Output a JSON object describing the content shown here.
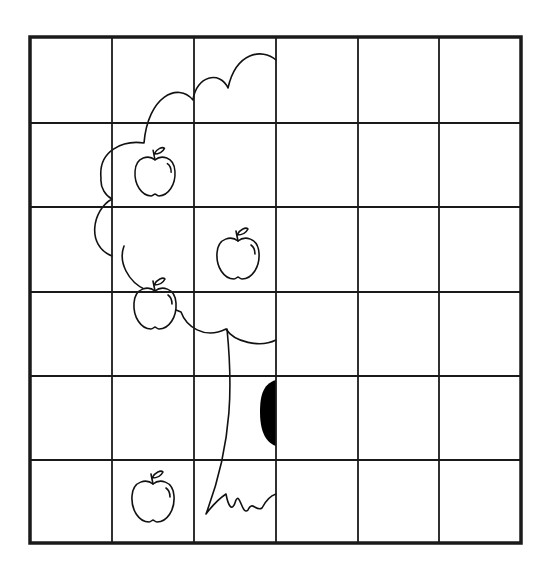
{
  "worksheet": {
    "title": "Symmetry drawing grid - half apple tree",
    "grid": {
      "rows": 6,
      "cols": 6,
      "x_lines": [
        30,
        112,
        194,
        276,
        358,
        439,
        521
      ],
      "y_lines": [
        37,
        123,
        207,
        292,
        376,
        460,
        543
      ],
      "line_color": "#1a1a1a",
      "border_width": 3.5,
      "line_width": 1.8
    },
    "drawing": {
      "subject": "half apple tree",
      "axis_of_symmetry_x": 276,
      "stroke_color": "#111111",
      "hollow_color": "#000000",
      "apples": [
        {
          "label": "apple-1",
          "cx": 155,
          "cy": 175,
          "scale": 0.95
        },
        {
          "label": "apple-2",
          "cx": 238,
          "cy": 257,
          "scale": 1.0
        },
        {
          "label": "apple-3",
          "cx": 155,
          "cy": 307,
          "scale": 1.0
        },
        {
          "label": "apple-4",
          "cx": 153,
          "cy": 500,
          "scale": 1.0
        }
      ]
    }
  }
}
